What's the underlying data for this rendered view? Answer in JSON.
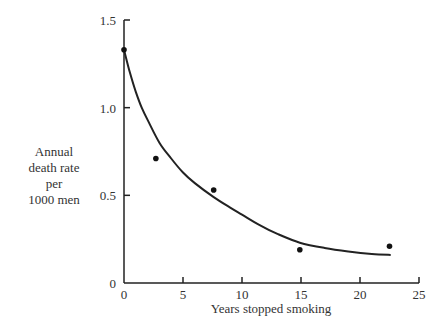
{
  "chart_data": {
    "type": "scatter",
    "title": "",
    "xlabel": "Years stopped smoking",
    "ylabel": "Annual death rate per 1000 men",
    "ylabel_lines": [
      "Annual",
      "death rate",
      "per",
      "1000 men"
    ],
    "xlim": [
      0,
      25
    ],
    "ylim": [
      0,
      1.5
    ],
    "xticks": [
      0,
      5,
      10,
      15,
      20,
      25
    ],
    "xtick_labels": [
      "0",
      "5",
      "10",
      "15",
      "20",
      "25"
    ],
    "yticks": [
      0,
      0.5,
      1.0,
      1.5
    ],
    "ytick_labels": [
      "0",
      "0.5",
      "1.0",
      "1.5"
    ],
    "grid": false,
    "legend": null,
    "series": [
      {
        "name": "Observed death rate",
        "kind": "scatter",
        "x": [
          0,
          2.7,
          7.6,
          14.9,
          22.5
        ],
        "y": [
          1.33,
          0.71,
          0.53,
          0.19,
          0.21
        ]
      },
      {
        "name": "Fitted curve",
        "kind": "line",
        "x": [
          0,
          0.5,
          1.0,
          1.5,
          2.0,
          3.0,
          4.0,
          5.0,
          6.0,
          7.6,
          9.0,
          10.0,
          11.5,
          13.0,
          14.9,
          17.0,
          19.0,
          21.0,
          22.6
        ],
        "y": [
          1.33,
          1.2,
          1.09,
          1.0,
          0.93,
          0.8,
          0.71,
          0.63,
          0.57,
          0.49,
          0.43,
          0.39,
          0.33,
          0.28,
          0.23,
          0.2,
          0.18,
          0.165,
          0.16
        ]
      }
    ]
  }
}
